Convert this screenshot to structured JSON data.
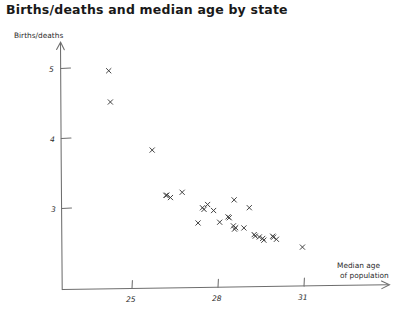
{
  "chart_data": {
    "type": "scatter",
    "title": "Births/deaths and median age by state",
    "xlabel": "Median age of population",
    "xlabel_line1": "Median age",
    "xlabel_line2": "of population",
    "ylabel": "Births/deaths",
    "grid": false,
    "legend": "none",
    "xlim": [
      23.0,
      32.8
    ],
    "ylim": [
      2.2,
      5.45
    ],
    "xticks": [
      25,
      28,
      31
    ],
    "xtick_labels": [
      "25",
      "28",
      "31"
    ],
    "yticks": [
      3,
      4,
      5
    ],
    "ytick_labels": [
      "3",
      "4",
      "5"
    ],
    "marker": "x",
    "marker_color": "#3a3a3a",
    "point_count": 30,
    "points": [
      {
        "x": 24.2,
        "y": 4.96
      },
      {
        "x": 24.25,
        "y": 4.52
      },
      {
        "x": 25.7,
        "y": 3.82
      },
      {
        "x": 26.2,
        "y": 3.18
      },
      {
        "x": 26.35,
        "y": 3.14
      },
      {
        "x": 26.75,
        "y": 3.22
      },
      {
        "x": 27.45,
        "y": 2.99
      },
      {
        "x": 27.65,
        "y": 3.03
      },
      {
        "x": 27.85,
        "y": 2.95
      },
      {
        "x": 27.3,
        "y": 2.77
      },
      {
        "x": 28.55,
        "y": 3.1
      },
      {
        "x": 29.1,
        "y": 2.98
      },
      {
        "x": 28.35,
        "y": 2.86
      },
      {
        "x": 28.05,
        "y": 2.78
      },
      {
        "x": 28.55,
        "y": 2.72
      },
      {
        "x": 28.58,
        "y": 2.68
      },
      {
        "x": 28.9,
        "y": 2.69
      },
      {
        "x": 29.25,
        "y": 2.6
      },
      {
        "x": 29.45,
        "y": 2.56
      },
      {
        "x": 29.6,
        "y": 2.52
      },
      {
        "x": 29.9,
        "y": 2.57
      },
      {
        "x": 30.05,
        "y": 2.52
      },
      {
        "x": 30.95,
        "y": 2.41
      },
      {
        "x": 26.18,
        "y": 3.17
      },
      {
        "x": 27.5,
        "y": 2.97
      },
      {
        "x": 28.4,
        "y": 2.84
      },
      {
        "x": 29.3,
        "y": 2.58
      },
      {
        "x": 29.55,
        "y": 2.54
      },
      {
        "x": 29.95,
        "y": 2.55
      },
      {
        "x": 28.62,
        "y": 2.7
      }
    ]
  },
  "axis_label_arrow": "arrow-glyph"
}
